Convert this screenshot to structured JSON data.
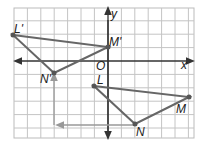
{
  "labels": {
    "L": "L",
    "M": "M",
    "N": "N",
    "Lp": "L'",
    "Mp": "M'",
    "Np": "N'",
    "O": "O",
    "x": "x",
    "y": "y"
  },
  "colors": {
    "grid": "#bbbbbb",
    "polygon": "#666666",
    "axis": "#333333",
    "arrow": "#999999"
  }
}
